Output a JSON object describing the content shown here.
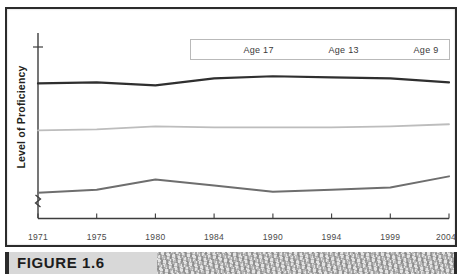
{
  "figure": {
    "caption": "FIGURE 1.6"
  },
  "chart_data": {
    "type": "line",
    "title": "",
    "xlabel": "",
    "ylabel": "Level of Proficiency",
    "grid": false,
    "legend_position": "top",
    "axis_break": true,
    "categories": [
      "1971",
      "1975",
      "1980",
      "1984",
      "1990",
      "1994",
      "1999",
      "2004"
    ],
    "ylim": [
      0,
      100
    ],
    "y_tick_labels": [],
    "series": [
      {
        "name": "Age 17",
        "color": "#2f2f2f",
        "values": [
          75.5,
          76.0,
          74.5,
          78.0,
          79.0,
          78.5,
          78.0,
          76.0
        ]
      },
      {
        "name": "Age 13",
        "color": "#bdbdbd",
        "values": [
          52.5,
          53.0,
          54.5,
          54.0,
          54.0,
          54.0,
          54.5,
          55.5
        ]
      },
      {
        "name": "Age 9",
        "color": "#6e6e6e",
        "values": [
          22.0,
          23.5,
          28.5,
          25.5,
          22.5,
          23.5,
          24.5,
          30.0
        ]
      }
    ]
  },
  "legend": {
    "items": [
      {
        "label": "Age 17",
        "color": "#2f2f2f"
      },
      {
        "label": "Age 13",
        "color": "#bdbdbd"
      },
      {
        "label": "Age 9",
        "color": "#6e6e6e"
      }
    ]
  },
  "axes": {
    "y_title": "Level of Proficiency",
    "x_ticks": [
      "1971",
      "1975",
      "1980",
      "1984",
      "1990",
      "1994",
      "1999",
      "2004"
    ]
  }
}
